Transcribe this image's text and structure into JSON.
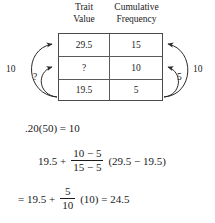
{
  "table": {
    "headers": [
      {
        "line1": "Trait",
        "line2": "Value"
      },
      {
        "line1": "Cumulative",
        "line2": "Frequency"
      }
    ],
    "rows": [
      {
        "trait_value": "29.5",
        "cumulative_frequency": "15"
      },
      {
        "trait_value": "?",
        "cumulative_frequency": "10"
      },
      {
        "trait_value": "19.5",
        "cumulative_frequency": "5"
      }
    ]
  },
  "annotations": {
    "left_outer": "10",
    "left_inner": "?",
    "right_inner": "5",
    "right_outer": "10"
  },
  "equations": {
    "line1": ".20(50) = 10",
    "line2": {
      "lead": "19.5 +",
      "numerator": "10 − 5",
      "denominator": "15 − 5",
      "trail": "(29.5 − 19.5)"
    },
    "line3": {
      "lead": "= 19.5 +",
      "numerator": "5",
      "denominator": "10",
      "trail": "(10) = 24.5"
    }
  },
  "colors": {
    "ink": "#1a1a1a",
    "rule": "#4a4a4a",
    "background": "#ffffff"
  }
}
